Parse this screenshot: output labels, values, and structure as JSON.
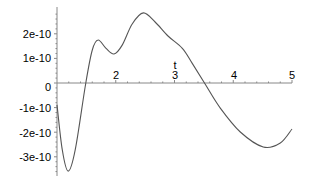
{
  "chart_data": {
    "type": "line",
    "title": "",
    "xlabel": "t",
    "ylabel": "",
    "xlim": [
      1,
      5
    ],
    "ylim": [
      -3.6e-10,
      2.9e-10
    ],
    "grid": false,
    "legend": null,
    "x_ticks": [
      "2",
      "3",
      "4",
      "5"
    ],
    "y_ticks": [
      "2e-10",
      "1e-10",
      "0",
      "-1e-10",
      "-2e-10",
      "-3e-10"
    ],
    "series": [
      {
        "name": "f(t)",
        "color": "#555555",
        "x": [
          1.0,
          1.09,
          1.19,
          1.31,
          1.49,
          1.6,
          1.7,
          1.83,
          1.97,
          2.11,
          2.28,
          2.47,
          2.67,
          2.89,
          3.13,
          3.3,
          3.52,
          3.78,
          4.12,
          4.51,
          4.8,
          5.0
        ],
        "y": [
          -8.9e-11,
          -2.72e-10,
          -3.58e-10,
          -2.72e-10,
          0.0,
          1.34e-10,
          1.75e-10,
          1.42e-10,
          1.18e-10,
          1.54e-10,
          2.4e-10,
          2.85e-10,
          2.48e-10,
          1.91e-10,
          1.42e-10,
          8.1e-11,
          -4e-12,
          -1.02e-10,
          -1.99e-10,
          -2.6e-10,
          -2.44e-10,
          -1.87e-10
        ]
      }
    ]
  },
  "axes": {
    "x_title": "t",
    "x_tick_labels": [
      "2",
      "3",
      "4",
      "5"
    ],
    "y_tick_labels": [
      "2e-10",
      "1e-10",
      "0",
      "-1e-10",
      "-2e-10",
      "-3e-10"
    ]
  }
}
